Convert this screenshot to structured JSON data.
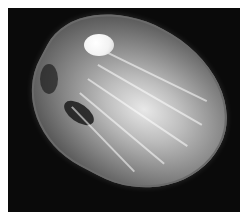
{
  "image": {
    "description": "Grayscale photograph of a bivalve shell on black background",
    "subject": "clam shell",
    "colors": {
      "background": "#0a0a0a",
      "border": "#ffffff",
      "shell_light": "#e8e8e8",
      "shell_dark": "#3a3a3a",
      "highlight": "#ffffff"
    }
  }
}
